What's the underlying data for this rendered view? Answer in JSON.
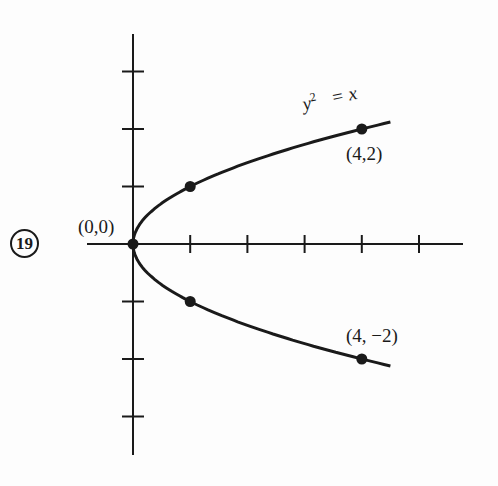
{
  "problem_number": "19",
  "chart_data": {
    "type": "line",
    "title": "",
    "equation": "y^2 = x",
    "equation_parts": {
      "lhs_var": "y",
      "exponent": "2",
      "rhs": "= x"
    },
    "xlabel": "",
    "ylabel": "",
    "xlim": [
      -0.5,
      5.7
    ],
    "ylim": [
      -3.7,
      3.7
    ],
    "x_ticks": [
      1,
      2,
      3,
      4,
      5
    ],
    "y_ticks": [
      -3,
      -2,
      -1,
      1,
      2,
      3
    ],
    "tick_labels_shown": false,
    "grid": false,
    "series": [
      {
        "name": "y^2 = x",
        "curve": "parabola opening right",
        "x_range": [
          0,
          4.5
        ]
      }
    ],
    "points": [
      {
        "x": 0,
        "y": 0,
        "label": "(0,0)"
      },
      {
        "x": 1,
        "y": 1,
        "label": ""
      },
      {
        "x": 1,
        "y": -1,
        "label": ""
      },
      {
        "x": 4,
        "y": 2,
        "label": "(4,2)"
      },
      {
        "x": 4,
        "y": -2,
        "label": "(4, −2)"
      }
    ]
  },
  "colors": {
    "ink": "#1a1a1a",
    "paper": "#fdfdfd"
  }
}
